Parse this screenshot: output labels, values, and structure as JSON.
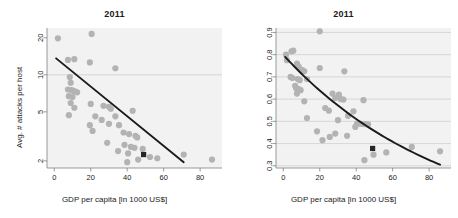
{
  "figure": {
    "panels": [
      {
        "id": "left",
        "title": "2011",
        "xlabel": "GDP per capita [in 1000 US$]",
        "ylabel": "Avg. # attacks per host"
      },
      {
        "id": "right",
        "title": "2011",
        "xlabel": "GDP per capita [in 1000 US$]",
        "ylabel": "% attacked hosts"
      }
    ]
  },
  "colors": {
    "panel_background": "#f2f2f2",
    "point": "#b3b3b3",
    "highlight_point": "#262626",
    "trend_line": "#1a1a1a",
    "gridline": "#cccccc",
    "axis": "#808080",
    "text": "#1a1a1a",
    "page_background": "#ffffff"
  },
  "chart_data": [
    {
      "type": "scatter",
      "panel": "left",
      "title": "2011",
      "xlabel": "GDP per capita [in 1000 US$]",
      "ylabel": "Avg. # attacks per host",
      "xlim": [
        -4,
        92
      ],
      "ylim": [
        1.75,
        24
      ],
      "yscale": "log",
      "xscale": "linear",
      "xticks": [
        0,
        20,
        40,
        60,
        80
      ],
      "yticks": [
        2,
        5,
        10,
        20
      ],
      "grid": "horizontal-at-y10",
      "legend": "none",
      "points": [
        {
          "x": 2.0,
          "y": 19.8
        },
        {
          "x": 20.5,
          "y": 21.5
        },
        {
          "x": 7.5,
          "y": 13.2
        },
        {
          "x": 11.0,
          "y": 13.4
        },
        {
          "x": 19.5,
          "y": 12.6
        },
        {
          "x": 33.5,
          "y": 11.3
        },
        {
          "x": 8.5,
          "y": 9.6
        },
        {
          "x": 9.0,
          "y": 8.6
        },
        {
          "x": 7.5,
          "y": 7.6
        },
        {
          "x": 9.5,
          "y": 7.5
        },
        {
          "x": 10.5,
          "y": 7.4
        },
        {
          "x": 11.5,
          "y": 7.3
        },
        {
          "x": 12.5,
          "y": 7.2
        },
        {
          "x": 8.0,
          "y": 6.7
        },
        {
          "x": 10.0,
          "y": 6.6
        },
        {
          "x": 9.0,
          "y": 5.9
        },
        {
          "x": 20.0,
          "y": 5.8
        },
        {
          "x": 11.0,
          "y": 5.4
        },
        {
          "x": 27.0,
          "y": 5.6
        },
        {
          "x": 30.0,
          "y": 5.5
        },
        {
          "x": 31.0,
          "y": 5.3
        },
        {
          "x": 43.0,
          "y": 5.1
        },
        {
          "x": 8.0,
          "y": 4.7
        },
        {
          "x": 22.5,
          "y": 4.6
        },
        {
          "x": 33.5,
          "y": 4.6
        },
        {
          "x": 26.0,
          "y": 4.3
        },
        {
          "x": 19.5,
          "y": 3.9
        },
        {
          "x": 30.0,
          "y": 4.0
        },
        {
          "x": 35.5,
          "y": 3.9
        },
        {
          "x": 21.0,
          "y": 3.5
        },
        {
          "x": 38.0,
          "y": 3.4
        },
        {
          "x": 41.0,
          "y": 3.3
        },
        {
          "x": 44.5,
          "y": 3.2
        },
        {
          "x": 45.5,
          "y": 3.1
        },
        {
          "x": 29.0,
          "y": 2.8
        },
        {
          "x": 38.5,
          "y": 2.7
        },
        {
          "x": 42.0,
          "y": 2.6
        },
        {
          "x": 44.0,
          "y": 2.55
        },
        {
          "x": 48.5,
          "y": 2.5
        },
        {
          "x": 35.0,
          "y": 2.4
        },
        {
          "x": 40.5,
          "y": 2.3
        },
        {
          "x": 46.0,
          "y": 2.05
        },
        {
          "x": 52.5,
          "y": 2.15
        },
        {
          "x": 56.5,
          "y": 2.1
        },
        {
          "x": 71.0,
          "y": 2.25
        },
        {
          "x": 86.5,
          "y": 2.05
        },
        {
          "x": 40.0,
          "y": 1.95
        }
      ],
      "highlight_point": {
        "x": 49.0,
        "y": 2.25,
        "marker": "filled-square"
      },
      "trend_line": {
        "kind": "linear-on-log-y",
        "start": {
          "x": 1.0,
          "y": 13.6
        },
        "end": {
          "x": 71.0,
          "y": 1.95
        }
      }
    },
    {
      "type": "scatter",
      "panel": "right",
      "title": "2011",
      "xlabel": "GDP per capita [in 1000 US$]",
      "ylabel": "% attacked hosts",
      "xlim": [
        -4,
        92
      ],
      "ylim": [
        0.29,
        0.92
      ],
      "yscale": "linear",
      "xscale": "linear",
      "xticks": [
        0,
        20,
        40,
        60,
        80
      ],
      "yticks": [
        0.3,
        0.4,
        0.5,
        0.6,
        0.7,
        0.8,
        0.9
      ],
      "grid": "horizontal-all-yticks",
      "legend": "none",
      "points": [
        {
          "x": 20.0,
          "y": 0.905
        },
        {
          "x": 1.5,
          "y": 0.8
        },
        {
          "x": 4.5,
          "y": 0.815
        },
        {
          "x": 5.5,
          "y": 0.818
        },
        {
          "x": 2.0,
          "y": 0.775
        },
        {
          "x": 7.5,
          "y": 0.76
        },
        {
          "x": 8.5,
          "y": 0.745
        },
        {
          "x": 10.5,
          "y": 0.73
        },
        {
          "x": 11.5,
          "y": 0.725
        },
        {
          "x": 20.0,
          "y": 0.74
        },
        {
          "x": 33.5,
          "y": 0.725
        },
        {
          "x": 4.0,
          "y": 0.7
        },
        {
          "x": 5.0,
          "y": 0.695
        },
        {
          "x": 8.0,
          "y": 0.69
        },
        {
          "x": 9.0,
          "y": 0.685
        },
        {
          "x": 13.0,
          "y": 0.69
        },
        {
          "x": 6.5,
          "y": 0.66
        },
        {
          "x": 7.0,
          "y": 0.65
        },
        {
          "x": 8.5,
          "y": 0.645
        },
        {
          "x": 9.5,
          "y": 0.64
        },
        {
          "x": 7.5,
          "y": 0.625
        },
        {
          "x": 27.0,
          "y": 0.625
        },
        {
          "x": 30.5,
          "y": 0.62
        },
        {
          "x": 28.5,
          "y": 0.605
        },
        {
          "x": 31.5,
          "y": 0.6
        },
        {
          "x": 33.0,
          "y": 0.598
        },
        {
          "x": 11.5,
          "y": 0.59
        },
        {
          "x": 44.0,
          "y": 0.595
        },
        {
          "x": 23.0,
          "y": 0.56
        },
        {
          "x": 25.0,
          "y": 0.548
        },
        {
          "x": 38.5,
          "y": 0.545
        },
        {
          "x": 35.5,
          "y": 0.525
        },
        {
          "x": 13.0,
          "y": 0.515
        },
        {
          "x": 30.0,
          "y": 0.505
        },
        {
          "x": 40.5,
          "y": 0.49
        },
        {
          "x": 42.0,
          "y": 0.49
        },
        {
          "x": 43.5,
          "y": 0.488
        },
        {
          "x": 45.0,
          "y": 0.487
        },
        {
          "x": 46.5,
          "y": 0.486
        },
        {
          "x": 39.5,
          "y": 0.475
        },
        {
          "x": 18.5,
          "y": 0.455
        },
        {
          "x": 28.5,
          "y": 0.445
        },
        {
          "x": 35.0,
          "y": 0.435
        },
        {
          "x": 25.5,
          "y": 0.43
        },
        {
          "x": 21.5,
          "y": 0.415
        },
        {
          "x": 70.5,
          "y": 0.385
        },
        {
          "x": 86.0,
          "y": 0.365
        },
        {
          "x": 56.5,
          "y": 0.36
        },
        {
          "x": 49.5,
          "y": 0.35
        },
        {
          "x": 44.5,
          "y": 0.325
        }
      ],
      "highlight_point": {
        "x": 49.0,
        "y": 0.378,
        "marker": "filled-square"
      },
      "trend_line": {
        "kind": "exponential-decay",
        "start": {
          "x": 1.0,
          "y": 0.79
        },
        "end": {
          "x": 86.0,
          "y": 0.305
        }
      }
    }
  ]
}
